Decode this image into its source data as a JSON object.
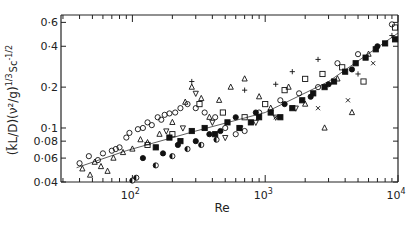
{
  "chart_data": {
    "type": "scatter",
    "title": "",
    "xlabel": "Re",
    "ylabel": "(k̄L/D)(ν²/g)^1/3 Sc^-1/2",
    "ylabel_parts": {
      "main": "(k̄L/D)(ν²/g)",
      "exp1": "1/3",
      "sc": "Sc",
      "exp2": "-1/2"
    },
    "xscale": "log",
    "yscale": "log",
    "xlim": [
      29,
      10000
    ],
    "ylim": [
      0.04,
      0.68
    ],
    "xticks": [
      {
        "value": 100,
        "label": "10",
        "sup": "2"
      },
      {
        "value": 1000,
        "label": "10",
        "sup": "3"
      },
      {
        "value": 10000,
        "label": "10",
        "sup": "4"
      }
    ],
    "yticks": [
      {
        "value": 0.04,
        "label": "0·04"
      },
      {
        "value": 0.06,
        "label": "0·06"
      },
      {
        "value": 0.08,
        "label": "0·08"
      },
      {
        "value": 0.1,
        "label": "0·1"
      },
      {
        "value": 0.2,
        "label": "0·2"
      },
      {
        "value": 0.4,
        "label": "0·4"
      },
      {
        "value": 0.6,
        "label": "0·6"
      }
    ],
    "grid": false,
    "legend": null,
    "fit_line": {
      "x": [
        38,
        90,
        300,
        1000,
        3000,
        10000
      ],
      "y": [
        0.051,
        0.068,
        0.095,
        0.13,
        0.22,
        0.5
      ]
    },
    "series": [
      {
        "name": "open circle",
        "marker": "circle-open",
        "points": [
          [
            40,
            0.055
          ],
          [
            47,
            0.062
          ],
          [
            55,
            0.058
          ],
          [
            60,
            0.065
          ],
          [
            70,
            0.068
          ],
          [
            75,
            0.07
          ],
          [
            80,
            0.072
          ],
          [
            90,
            0.085
          ],
          [
            95,
            0.092
          ],
          [
            110,
            0.098
          ],
          [
            120,
            0.1
          ],
          [
            130,
            0.11
          ],
          [
            140,
            0.105
          ],
          [
            155,
            0.12
          ],
          [
            165,
            0.115
          ],
          [
            175,
            0.125
          ],
          [
            190,
            0.128
          ],
          [
            210,
            0.13
          ],
          [
            230,
            0.14
          ],
          [
            260,
            0.15
          ],
          [
            300,
            0.14
          ],
          [
            350,
            0.13
          ],
          [
            420,
            0.12
          ],
          [
            500,
            0.1
          ],
          [
            600,
            0.09
          ],
          [
            700,
            0.095
          ],
          [
            900,
            0.13
          ],
          [
            1300,
            0.16
          ],
          [
            1800,
            0.18
          ],
          [
            2500,
            0.2
          ],
          [
            3500,
            0.3
          ],
          [
            5000,
            0.35
          ],
          [
            9000,
            0.58
          ]
        ]
      },
      {
        "name": "open triangle",
        "marker": "triangle-open",
        "points": [
          [
            42,
            0.05
          ],
          [
            48,
            0.045
          ],
          [
            52,
            0.056
          ],
          [
            58,
            0.052
          ],
          [
            65,
            0.048
          ],
          [
            72,
            0.06
          ],
          [
            85,
            0.066
          ],
          [
            100,
            0.07
          ],
          [
            115,
            0.082
          ],
          [
            130,
            0.078
          ],
          [
            160,
            0.09
          ],
          [
            200,
            0.11
          ],
          [
            250,
            0.155
          ],
          [
            280,
            0.2
          ],
          [
            330,
            0.165
          ],
          [
            380,
            0.12
          ],
          [
            450,
            0.16
          ],
          [
            550,
            0.2
          ],
          [
            700,
            0.23
          ],
          [
            900,
            0.17
          ],
          [
            1100,
            0.14
          ],
          [
            1500,
            0.2
          ],
          [
            2000,
            0.15
          ],
          [
            2800,
            0.1
          ],
          [
            3500,
            0.23
          ],
          [
            4500,
            0.13
          ],
          [
            6000,
            0.35
          ]
        ]
      },
      {
        "name": "inverted triangle",
        "marker": "triangle-down-open",
        "points": [
          [
            180,
            0.095
          ],
          [
            240,
            0.1
          ],
          [
            300,
            0.18
          ],
          [
            400,
            0.11
          ],
          [
            500,
            0.085
          ],
          [
            650,
            0.1
          ],
          [
            850,
            0.11
          ],
          [
            1200,
            0.12
          ],
          [
            1700,
            0.14
          ]
        ]
      },
      {
        "name": "open square",
        "marker": "square-open",
        "points": [
          [
            130,
            0.075
          ],
          [
            200,
            0.09
          ],
          [
            320,
            0.15
          ],
          [
            480,
            0.13
          ],
          [
            700,
            0.12
          ],
          [
            1000,
            0.15
          ],
          [
            1400,
            0.19
          ],
          [
            2000,
            0.23
          ],
          [
            2700,
            0.25
          ],
          [
            3800,
            0.28
          ],
          [
            5500,
            0.22
          ],
          [
            9500,
            0.55
          ]
        ]
      },
      {
        "name": "filled square",
        "marker": "square-filled",
        "points": [
          [
            150,
            0.072
          ],
          [
            190,
            0.085
          ],
          [
            230,
            0.08
          ],
          [
            280,
            0.095
          ],
          [
            350,
            0.1
          ],
          [
            420,
            0.09
          ],
          [
            520,
            0.11
          ],
          [
            640,
            0.1
          ],
          [
            780,
            0.11
          ],
          [
            900,
            0.12
          ],
          [
            1100,
            0.13
          ],
          [
            1300,
            0.12
          ],
          [
            1600,
            0.14
          ],
          [
            1900,
            0.16
          ],
          [
            2300,
            0.18
          ],
          [
            2800,
            0.2
          ],
          [
            3300,
            0.22
          ],
          [
            4000,
            0.26
          ],
          [
            4800,
            0.3
          ],
          [
            5700,
            0.33
          ],
          [
            6800,
            0.38
          ],
          [
            8000,
            0.42
          ],
          [
            9500,
            0.45
          ]
        ]
      },
      {
        "name": "filled circle",
        "marker": "circle-filled",
        "points": [
          [
            120,
            0.06
          ],
          [
            170,
            0.065
          ],
          [
            220,
            0.075
          ],
          [
            300,
            0.08
          ],
          [
            380,
            0.09
          ],
          [
            460,
            0.095
          ],
          [
            600,
            0.12
          ],
          [
            850,
            0.13
          ],
          [
            1400,
            0.15
          ],
          [
            2200,
            0.17
          ],
          [
            3000,
            0.21
          ],
          [
            4500,
            0.27
          ],
          [
            7000,
            0.4
          ]
        ]
      },
      {
        "name": "half-filled circle",
        "marker": "circle-half",
        "points": [
          [
            100,
            0.041
          ],
          [
            107,
            0.043
          ],
          [
            150,
            0.053
          ],
          [
            200,
            0.062
          ],
          [
            260,
            0.07
          ],
          [
            330,
            0.075
          ],
          [
            430,
            0.082
          ]
        ]
      },
      {
        "name": "plus",
        "marker": "plus",
        "points": [
          [
            280,
            0.22
          ],
          [
            700,
            0.19
          ],
          [
            1200,
            0.21
          ],
          [
            1600,
            0.26
          ],
          [
            2500,
            0.32
          ],
          [
            5000,
            0.25
          ],
          [
            9000,
            0.48
          ]
        ]
      },
      {
        "name": "cross",
        "marker": "x",
        "points": [
          [
            1200,
            0.12
          ],
          [
            2500,
            0.14
          ],
          [
            4200,
            0.16
          ],
          [
            6500,
            0.3
          ]
        ]
      }
    ]
  }
}
